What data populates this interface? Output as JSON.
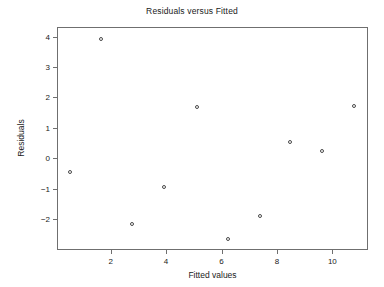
{
  "chart_data": {
    "type": "scatter",
    "title": "Residuals versus Fitted",
    "xlabel": "Fitted values",
    "ylabel": "Residuals",
    "grid": false,
    "legend": false,
    "xlim": [
      0.1,
      11.25
    ],
    "ylim": [
      -2.98,
      4.28
    ],
    "xticks": [
      2,
      4,
      6,
      8,
      10
    ],
    "xticklabels": [
      "2",
      "4",
      "6",
      "8",
      "10"
    ],
    "yticks": [
      4,
      3,
      2,
      1,
      0,
      -1,
      -2
    ],
    "yticklabels": [
      "4",
      "3",
      "2",
      "1",
      "0",
      "−1",
      "−2"
    ],
    "marker": "open-circle",
    "marker_color": "#4a4a4a",
    "axis_color": "#6f6f6f",
    "background": "#ffffff",
    "x": [
      0.55,
      1.65,
      2.77,
      3.94,
      5.11,
      6.22,
      7.39,
      8.48,
      9.64,
      10.79
    ],
    "y": [
      -0.45,
      3.93,
      -2.15,
      -0.95,
      1.68,
      -2.65,
      -1.9,
      0.55,
      0.23,
      1.72
    ],
    "points": [
      {
        "x": 0.55,
        "y": -0.45
      },
      {
        "x": 1.65,
        "y": 3.93
      },
      {
        "x": 2.77,
        "y": -2.15
      },
      {
        "x": 3.94,
        "y": -0.95
      },
      {
        "x": 5.11,
        "y": 1.68
      },
      {
        "x": 6.22,
        "y": -2.65
      },
      {
        "x": 7.39,
        "y": -1.9
      },
      {
        "x": 8.48,
        "y": 0.55
      },
      {
        "x": 9.64,
        "y": 0.23
      },
      {
        "x": 10.79,
        "y": 1.72
      }
    ]
  }
}
